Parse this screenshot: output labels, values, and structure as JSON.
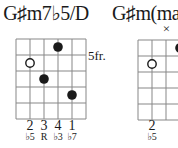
{
  "sheet": {
    "background": "#ffffff",
    "ink_color": "#1a1a1a",
    "grid_color": "#878787"
  },
  "chords": [
    {
      "title": "G♯m7♭5/D",
      "fret_label": "5fr.",
      "markers": [
        {
          "string": 4,
          "fret_row": 1,
          "type": "filled"
        },
        {
          "string": 2,
          "fret_row": 2,
          "type": "open"
        },
        {
          "string": 3,
          "fret_row": 3,
          "type": "filled"
        },
        {
          "string": 5,
          "fret_row": 4,
          "type": "filled"
        }
      ],
      "fingering": [
        {
          "string": 2,
          "finger": "2",
          "note": "♭5"
        },
        {
          "string": 3,
          "finger": "3",
          "note": "R"
        },
        {
          "string": 4,
          "finger": "4",
          "note": "♭3"
        },
        {
          "string": 5,
          "finger": "1",
          "note": "♭7"
        }
      ],
      "muted": []
    },
    {
      "title": "G♯m(ma",
      "fret_label": "",
      "markers": [
        {
          "string": 4,
          "fret_row": 1,
          "type": "filled"
        },
        {
          "string": 2,
          "fret_row": 2,
          "type": "open"
        }
      ],
      "fingering": [
        {
          "string": 2,
          "finger": "2",
          "note": "♭5"
        }
      ],
      "muted": [
        {
          "string": 3,
          "symbol": "×"
        }
      ]
    }
  ]
}
